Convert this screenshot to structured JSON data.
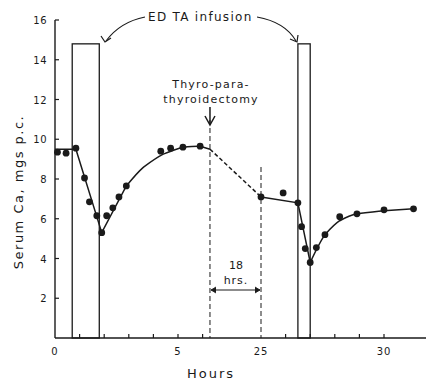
{
  "chart_data": {
    "type": "line",
    "title": "",
    "xlabel": "Hours",
    "ylabel": "Serum Ca, mgs p.c.",
    "ylim": [
      0,
      16
    ],
    "y_ticks": [
      2,
      4,
      6,
      8,
      10,
      12,
      14,
      16
    ],
    "x_axis_note": "broken time axis: 0–6.3 h, 18 hr gap, then 25–32 h",
    "x_tick_labels": [
      {
        "label": "0",
        "hour": 0
      },
      {
        "label": "5",
        "hour": 5
      },
      {
        "label": "25",
        "hour": 25
      },
      {
        "label": "30",
        "hour": 30
      }
    ],
    "grid": false,
    "annotations": {
      "edta_label": "ED TA infusion",
      "surgery_label_line1": "Thyro-para-",
      "surgery_label_line2": "thyroidectomy",
      "gap_label_line1": "18",
      "gap_label_line2": "hrs."
    },
    "edta_bars": [
      {
        "start_hour": 0.7,
        "end_hour": 1.8,
        "height": 14.8
      },
      {
        "start_hour": 26.5,
        "end_hour": 27.0,
        "height": 14.8
      }
    ],
    "surgery_hour": 6.3,
    "gap_end_hour": 25,
    "series": [
      {
        "name": "Serum Ca (measured)",
        "points": [
          {
            "x": 0.1,
            "y": 9.35
          },
          {
            "x": 0.45,
            "y": 9.3
          },
          {
            "x": 0.85,
            "y": 9.55
          },
          {
            "x": 1.2,
            "y": 8.05
          },
          {
            "x": 1.4,
            "y": 6.85
          },
          {
            "x": 1.7,
            "y": 6.15
          },
          {
            "x": 1.9,
            "y": 5.3
          },
          {
            "x": 2.1,
            "y": 6.15
          },
          {
            "x": 2.35,
            "y": 6.55
          },
          {
            "x": 2.6,
            "y": 7.1
          },
          {
            "x": 2.9,
            "y": 7.65
          },
          {
            "x": 4.3,
            "y": 9.4
          },
          {
            "x": 4.7,
            "y": 9.55
          },
          {
            "x": 5.2,
            "y": 9.6
          },
          {
            "x": 5.9,
            "y": 9.65
          },
          {
            "x": 25.0,
            "y": 7.1
          },
          {
            "x": 25.9,
            "y": 7.3
          },
          {
            "x": 26.5,
            "y": 6.8
          },
          {
            "x": 26.65,
            "y": 5.6
          },
          {
            "x": 26.8,
            "y": 4.5
          },
          {
            "x": 27.0,
            "y": 3.8
          },
          {
            "x": 27.25,
            "y": 4.55
          },
          {
            "x": 27.6,
            "y": 5.2
          },
          {
            "x": 28.2,
            "y": 6.1
          },
          {
            "x": 28.9,
            "y": 6.25
          },
          {
            "x": 30.0,
            "y": 6.45
          },
          {
            "x": 31.2,
            "y": 6.5
          }
        ]
      },
      {
        "name": "Fitted curve",
        "points": [
          {
            "x": 0,
            "y": 9.5
          },
          {
            "x": 0.85,
            "y": 9.5
          },
          {
            "x": 1.9,
            "y": 5.3
          },
          {
            "x": 2.9,
            "y": 7.65
          },
          {
            "x": 3.6,
            "y": 8.6
          },
          {
            "x": 4.4,
            "y": 9.25
          },
          {
            "x": 5.2,
            "y": 9.6
          },
          {
            "x": 5.9,
            "y": 9.65
          },
          {
            "x": 6.3,
            "y": 9.5
          },
          {
            "x": 25.0,
            "y": 7.1
          },
          {
            "x": 26.5,
            "y": 6.8
          },
          {
            "x": 27.0,
            "y": 3.8
          },
          {
            "x": 27.6,
            "y": 5.2
          },
          {
            "x": 28.2,
            "y": 5.9
          },
          {
            "x": 28.9,
            "y": 6.25
          },
          {
            "x": 30.0,
            "y": 6.4
          },
          {
            "x": 31.2,
            "y": 6.5
          }
        ],
        "segment_6.3_to_25": "dashed"
      }
    ]
  }
}
